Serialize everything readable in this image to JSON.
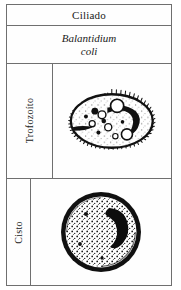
{
  "figure": {
    "group_label": "Ciliado",
    "species_line1": "Balantidium",
    "species_line2": "coli",
    "stages": [
      {
        "label": "Trofozoíto",
        "art": "balantidium-trophozoite-drawing"
      },
      {
        "label": "Cisto",
        "art": "balantidium-cyst-drawing"
      }
    ]
  },
  "colors": {
    "border": "#6f6f6f",
    "ink": "#1a1a1a",
    "paper": "#fefefe"
  }
}
